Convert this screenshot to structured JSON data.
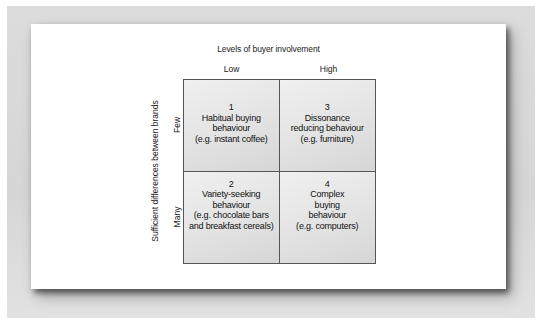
{
  "diagram": {
    "title": "Levels of buyer involvement",
    "columns": [
      "Low",
      "High"
    ],
    "row_axis_label": "Sufficient differences between brands",
    "rows": [
      "Few",
      "Many"
    ],
    "cells": [
      {
        "number": "1",
        "lines": [
          "Habitual buying",
          "behaviour",
          "(e.g. instant coffee)"
        ]
      },
      {
        "number": "3",
        "lines": [
          "Dissonance",
          "reducing behaviour",
          "(e.g. furniture)"
        ]
      },
      {
        "number": "2",
        "lines": [
          "Variety-seeking",
          "behaviour",
          "(e.g. chocolate bars",
          "and breakfast cereals)"
        ]
      },
      {
        "number": "4",
        "lines": [
          "Complex",
          "buying",
          "behaviour",
          "(e.g. computers)"
        ]
      }
    ],
    "colors": {
      "frame": "#d9d9d9",
      "card": "#ffffff",
      "cell_fill_light": "#f0f0f0",
      "cell_fill_dark": "#d6d6d6",
      "grid_line": "#555555",
      "text": "#222222"
    }
  }
}
